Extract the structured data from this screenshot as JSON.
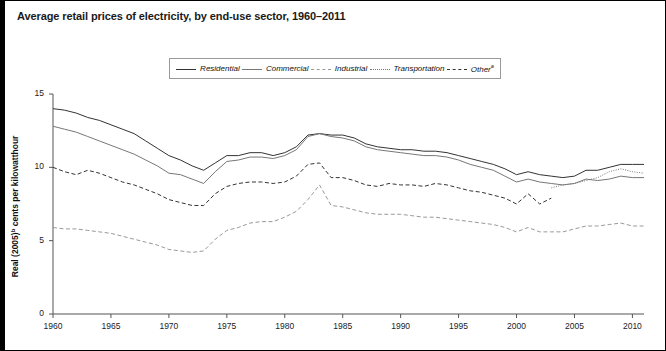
{
  "title": "Average retail prices of electricity, by end-use sector, 1960–2011",
  "legend": {
    "position": "top-center",
    "entries": [
      {
        "label": "Residential",
        "style": "solid",
        "color": "#333333",
        "name": "legend-item-residential"
      },
      {
        "label": "Commercial",
        "style": "solid",
        "color": "#777777",
        "name": "legend-item-commercial"
      },
      {
        "label": "Industrial",
        "style": "dashed",
        "color": "#999999",
        "name": "legend-item-industrial"
      },
      {
        "label": "Transportation",
        "style": "dotted",
        "color": "#777777",
        "name": "legend-item-transportation"
      },
      {
        "label": "Other",
        "footnote": "a",
        "style": "dashed",
        "color": "#333333",
        "name": "legend-item-other"
      }
    ]
  },
  "axes": {
    "y_label_main": "Real (2005)",
    "y_label_footnote": "b",
    "y_label_rest": " cents per kilowatthour",
    "y_ticks": [
      "0",
      "5",
      "10",
      "15"
    ],
    "x_ticks": [
      "1960",
      "1965",
      "1970",
      "1975",
      "1980",
      "1985",
      "1990",
      "1995",
      "2000",
      "2005",
      "2010"
    ]
  },
  "chart_data": {
    "type": "line",
    "title": "Average retail prices of electricity, by end-use sector, 1960–2011",
    "xlabel": "",
    "ylabel": "Real (2005) cents per kilowatthour",
    "xlim": [
      1960,
      2011
    ],
    "ylim": [
      0,
      15
    ],
    "grid": false,
    "legend_position": "top-center",
    "x": [
      1960,
      1961,
      1962,
      1963,
      1964,
      1965,
      1966,
      1967,
      1968,
      1969,
      1970,
      1971,
      1972,
      1973,
      1974,
      1975,
      1976,
      1977,
      1978,
      1979,
      1980,
      1981,
      1982,
      1983,
      1984,
      1985,
      1986,
      1987,
      1988,
      1989,
      1990,
      1991,
      1992,
      1993,
      1994,
      1995,
      1996,
      1997,
      1998,
      1999,
      2000,
      2001,
      2002,
      2003,
      2004,
      2005,
      2006,
      2007,
      2008,
      2009,
      2010,
      2011
    ],
    "series": [
      {
        "name": "Residential",
        "style": "solid",
        "color": "#333333",
        "values": [
          14.0,
          13.9,
          13.7,
          13.4,
          13.2,
          12.9,
          12.6,
          12.3,
          11.8,
          11.3,
          10.8,
          10.5,
          10.1,
          9.8,
          10.3,
          10.8,
          10.8,
          11.0,
          11.0,
          10.8,
          11.0,
          11.4,
          12.2,
          12.3,
          12.2,
          12.2,
          12.0,
          11.6,
          11.4,
          11.3,
          11.2,
          11.2,
          11.1,
          11.1,
          11.0,
          10.8,
          10.6,
          10.4,
          10.2,
          9.9,
          9.5,
          9.7,
          9.5,
          9.4,
          9.3,
          9.4,
          9.8,
          9.8,
          10.0,
          10.2,
          10.2,
          10.2
        ]
      },
      {
        "name": "Commercial",
        "style": "solid",
        "color": "#777777",
        "values": [
          12.8,
          12.6,
          12.4,
          12.1,
          11.8,
          11.5,
          11.2,
          10.9,
          10.5,
          10.1,
          9.6,
          9.5,
          9.2,
          8.9,
          9.7,
          10.4,
          10.5,
          10.7,
          10.7,
          10.6,
          10.8,
          11.2,
          12.1,
          12.3,
          12.1,
          12.0,
          11.8,
          11.4,
          11.2,
          11.1,
          11.0,
          10.9,
          10.8,
          10.8,
          10.7,
          10.5,
          10.2,
          10.0,
          9.8,
          9.4,
          9.0,
          9.2,
          9.0,
          8.9,
          8.8,
          8.9,
          9.2,
          9.1,
          9.2,
          9.4,
          9.3,
          9.3
        ]
      },
      {
        "name": "Other",
        "style": "dashed",
        "color": "#333333",
        "values": [
          10.0,
          9.7,
          9.5,
          9.8,
          9.6,
          9.3,
          9.0,
          8.8,
          8.5,
          8.2,
          7.8,
          7.6,
          7.4,
          7.4,
          8.2,
          8.7,
          8.9,
          9.0,
          9.0,
          8.9,
          9.0,
          9.4,
          10.2,
          10.3,
          9.3,
          9.3,
          9.1,
          8.8,
          8.7,
          8.9,
          8.8,
          8.8,
          8.7,
          8.9,
          8.8,
          8.6,
          8.4,
          8.3,
          8.1,
          7.9,
          7.5,
          8.2,
          7.5,
          7.9,
          null,
          null,
          null,
          null,
          null,
          null,
          null,
          null
        ]
      },
      {
        "name": "Transportation",
        "style": "dotted",
        "color": "#777777",
        "values": [
          null,
          null,
          null,
          null,
          null,
          null,
          null,
          null,
          null,
          null,
          null,
          null,
          null,
          null,
          null,
          null,
          null,
          null,
          null,
          null,
          null,
          null,
          null,
          null,
          null,
          null,
          null,
          null,
          null,
          null,
          null,
          null,
          null,
          null,
          null,
          null,
          null,
          null,
          null,
          null,
          null,
          null,
          null,
          8.6,
          8.8,
          8.9,
          9.1,
          9.3,
          9.7,
          9.9,
          9.7,
          9.6
        ]
      },
      {
        "name": "Industrial",
        "style": "dashed",
        "color": "#999999",
        "values": [
          5.9,
          5.8,
          5.8,
          5.7,
          5.6,
          5.5,
          5.3,
          5.1,
          4.9,
          4.7,
          4.4,
          4.3,
          4.2,
          4.3,
          5.1,
          5.7,
          5.9,
          6.2,
          6.3,
          6.3,
          6.6,
          7.0,
          7.8,
          8.8,
          7.4,
          7.3,
          7.1,
          6.9,
          6.8,
          6.8,
          6.8,
          6.7,
          6.6,
          6.6,
          6.5,
          6.4,
          6.3,
          6.2,
          6.1,
          5.9,
          5.6,
          5.9,
          5.6,
          5.6,
          5.6,
          5.8,
          6.0,
          6.0,
          6.1,
          6.2,
          6.0,
          6.0
        ]
      }
    ]
  }
}
